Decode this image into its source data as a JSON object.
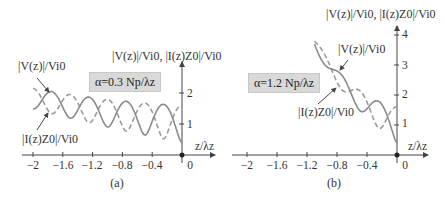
{
  "colors": {
    "solid_curve": "#8a8a8a",
    "dashed_curve": "#9a9a9a",
    "axis": "#444444",
    "box_bg": "#d9d9d9"
  },
  "panels": [
    {
      "caption": "(a)",
      "y_axis_label": "|V(z)|/Vi0, |I(z)Z0|/Vi0",
      "x_axis_label": "z/λz",
      "alpha_label": "α=0.3 Np/λz",
      "v_label": "|V(z)|/Vi0",
      "i_label": "|I(z)Z0|/Vi0",
      "x_ticks": [
        "−2",
        "−1.6",
        "−1.2",
        "−0.8",
        "−0.4",
        "0"
      ],
      "y_ticks": [
        "1",
        "2"
      ]
    },
    {
      "caption": "(b)",
      "y_axis_label": "|V(z)|/Vi0, |I(z)Z0|/Vi0",
      "x_axis_label": "z/λz",
      "alpha_label": "α=1.2 Np/λz",
      "v_label": "|V(z)|/Vi0",
      "i_label": "|I(z)Z0|/Vi0",
      "x_ticks": [
        "−2",
        "−1.6",
        "−1.2",
        "−0.8",
        "−0.4",
        "0"
      ],
      "y_ticks": [
        "1",
        "2",
        "3",
        "4"
      ]
    }
  ],
  "chart_data": [
    {
      "type": "line",
      "title": "(a) α=0.3 Np/λz",
      "xlabel": "z/λz",
      "ylabel": "|V(z)|/Vi0, |I(z)Z0|/Vi0",
      "xlim": [
        -2.1,
        0.1
      ],
      "ylim": [
        0,
        2.5
      ],
      "grid": false,
      "params": {
        "alpha_Np_per_lambda": 0.3,
        "reflection_coefficient": -0.6,
        "z_start": -2.0
      },
      "series": [
        {
          "name": "|V(z)|/Vi0",
          "style": "solid",
          "x": [
            -2.0,
            -1.8,
            -1.55,
            -1.3,
            -1.05,
            -0.8,
            -0.55,
            -0.3,
            -0.05,
            0.0
          ],
          "values": [
            1.55,
            2.05,
            1.2,
            1.9,
            1.2,
            1.75,
            1.2,
            1.6,
            0.5,
            0.4
          ]
        },
        {
          "name": "|I(z)Z0|/Vi0",
          "style": "dashed",
          "x": [
            -2.0,
            -1.8,
            -1.55,
            -1.3,
            -1.05,
            -0.8,
            -0.55,
            -0.3,
            -0.05,
            0.0
          ],
          "values": [
            1.9,
            1.35,
            1.95,
            1.3,
            1.85,
            1.2,
            1.7,
            1.0,
            1.5,
            1.6
          ]
        }
      ]
    },
    {
      "type": "line",
      "title": "(b) α=1.2 Np/λz",
      "xlabel": "z/λz",
      "ylabel": "|V(z)|/Vi0, |I(z)Z0|/Vi0",
      "xlim": [
        -2.1,
        0.1
      ],
      "ylim": [
        0,
        4.3
      ],
      "grid": false,
      "params": {
        "alpha_Np_per_lambda": 1.2,
        "reflection_coefficient": -0.6,
        "z_start": -1.1
      },
      "series": [
        {
          "name": "|V(z)|/Vi0",
          "style": "solid",
          "x": [
            -1.1,
            -0.9,
            -0.75,
            -0.55,
            -0.4,
            -0.25,
            -0.1,
            0.0
          ],
          "values": [
            3.95,
            2.9,
            2.75,
            1.5,
            1.55,
            1.8,
            0.9,
            0.4
          ]
        },
        {
          "name": "|I(z)Z0|/Vi0",
          "style": "dashed",
          "x": [
            -1.05,
            -0.9,
            -0.8,
            -0.6,
            -0.45,
            -0.25,
            -0.1,
            0.0
          ],
          "values": [
            3.9,
            2.95,
            2.2,
            2.2,
            1.8,
            0.95,
            1.4,
            1.6
          ]
        }
      ]
    }
  ]
}
